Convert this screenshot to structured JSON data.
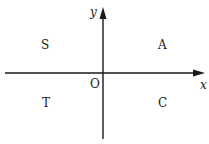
{
  "diagram": {
    "axes": {
      "x_label": "x",
      "y_label": "y",
      "origin_label": "O"
    },
    "quadrants": {
      "q1": "A",
      "q2": "S",
      "q3": "T",
      "q4": "C"
    },
    "colors": {
      "line": "#1a1a1a",
      "background": "#ffffff"
    }
  }
}
